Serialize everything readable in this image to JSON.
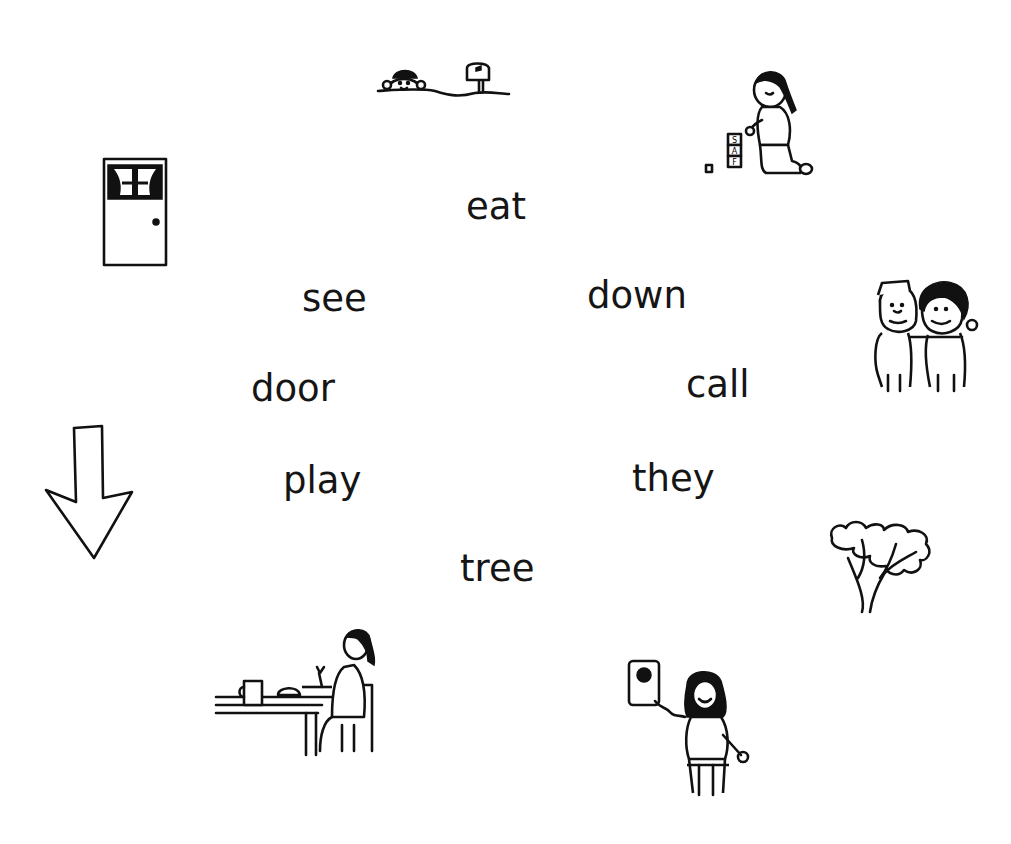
{
  "worksheet": {
    "words": [
      {
        "id": "eat",
        "text": "eat"
      },
      {
        "id": "see",
        "text": "see"
      },
      {
        "id": "down",
        "text": "down"
      },
      {
        "id": "door",
        "text": "door"
      },
      {
        "id": "call",
        "text": "call"
      },
      {
        "id": "play",
        "text": "play"
      },
      {
        "id": "they",
        "text": "they"
      },
      {
        "id": "tree",
        "text": "tree"
      }
    ],
    "pictures": [
      {
        "id": "down",
        "depicts": "child behind hill next to mailbox"
      },
      {
        "id": "play",
        "depicts": "girl playing with blocks"
      },
      {
        "id": "door",
        "depicts": "door with curtained window"
      },
      {
        "id": "they",
        "depicts": "two friends hugging"
      },
      {
        "id": "see",
        "depicts": "down arrow"
      },
      {
        "id": "tree",
        "depicts": "tree"
      },
      {
        "id": "eat",
        "depicts": "girl eating at table"
      },
      {
        "id": "call",
        "depicts": "girl on telephone"
      }
    ],
    "block_letters": [
      "S",
      "A",
      "F"
    ]
  }
}
